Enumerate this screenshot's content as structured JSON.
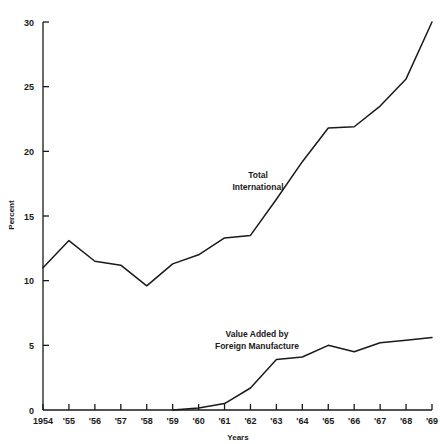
{
  "chart_data": {
    "type": "line",
    "title": "",
    "xlabel": "Years",
    "ylabel": "Percent",
    "grid": false,
    "legend_position": "inline-annotations",
    "ylim": [
      0,
      30
    ],
    "yticks": [
      0,
      5,
      10,
      15,
      20,
      25,
      30
    ],
    "ytick_labels": [
      "0",
      "5",
      "10",
      "15",
      "20",
      "25",
      "30"
    ],
    "categories": [
      "1954",
      "1955",
      "1956",
      "1957",
      "1958",
      "1959",
      "1960",
      "1961",
      "1962",
      "1963",
      "1964",
      "1965",
      "1966",
      "1967",
      "1968",
      "1969"
    ],
    "xtick_labels": [
      "1954",
      "'55",
      "'56",
      "'57",
      "'58",
      "'59",
      "'60",
      "'61",
      "'62",
      "'63",
      "'64",
      "'65",
      "'66",
      "'67",
      "'68",
      "'69"
    ],
    "series": [
      {
        "name": "Total International",
        "label_line1": "Total",
        "label_line2": "International",
        "values": [
          11.0,
          13.1,
          11.5,
          11.2,
          9.6,
          11.3,
          12.0,
          13.3,
          13.5,
          16.3,
          19.2,
          21.8,
          21.9,
          23.5,
          25.6,
          30.0
        ]
      },
      {
        "name": "Value Added by Foreign Manufacture",
        "label_line1": "Value Added by",
        "label_line2": "Foreign Manufacture",
        "values": [
          null,
          null,
          null,
          null,
          null,
          0.0,
          0.15,
          0.5,
          1.7,
          3.9,
          4.1,
          5.0,
          4.5,
          5.2,
          5.4,
          5.6
        ]
      }
    ],
    "colors": {
      "line": "#1a1a1a",
      "axis": "#1a1a1a",
      "background": "#ffffff"
    }
  }
}
